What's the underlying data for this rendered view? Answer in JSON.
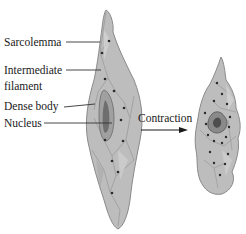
{
  "labels": {
    "sarcolemma": "Sarcolemma",
    "intermediate_line1": "Intermediate",
    "intermediate_line2": "filament",
    "dense_body": "Dense body",
    "nucleus": "Nucleus",
    "contraction": "Contraction"
  },
  "colors": {
    "cell_fill": "#b9b9b9",
    "cell_stroke": "#8a8a8a",
    "nucleus_fill": "#6e6e6e",
    "dense_body_dot": "#2a2a2a",
    "leader_line": "#333333",
    "text": "#1a1a1a"
  }
}
